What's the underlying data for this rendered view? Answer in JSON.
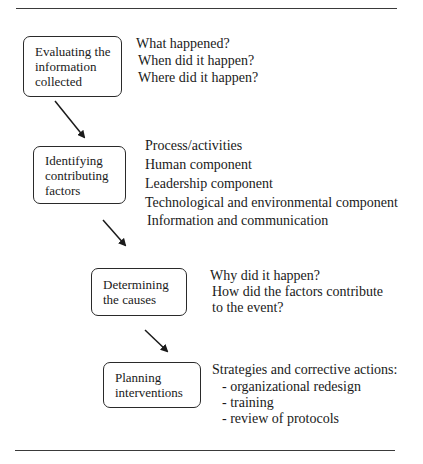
{
  "steps": [
    {
      "label_lines": [
        "Evaluating the",
        "information",
        "collected"
      ],
      "details": [
        "What happened?",
        "When did it happen?",
        "Where did it happen?"
      ]
    },
    {
      "label_lines": [
        "Identifying",
        "contributing",
        "factors"
      ],
      "details": [
        "Process/activities",
        "Human component",
        "Leadership component",
        "Technological and environmental component",
        "Information and communication"
      ]
    },
    {
      "label_lines": [
        "Determining",
        "the causes"
      ],
      "details": [
        "Why did it happen?",
        "How did the factors contribute",
        "to the event?"
      ]
    },
    {
      "label_lines": [
        "Planning",
        "interventions"
      ],
      "details": [
        "Strategies and corrective actions:",
        "- organizational redesign",
        "- training",
        "- review of protocols"
      ]
    }
  ],
  "colors": {
    "line": "#2a2a2a",
    "text": "#1a1a1a",
    "background": "#ffffff"
  }
}
